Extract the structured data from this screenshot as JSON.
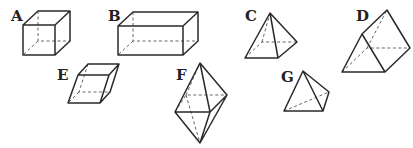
{
  "figure": {
    "shapes": [
      {
        "label": "A",
        "name": "cube"
      },
      {
        "label": "B",
        "name": "rectangular prism (cuboid)"
      },
      {
        "label": "C",
        "name": "square pyramid"
      },
      {
        "label": "D",
        "name": "triangular prism"
      },
      {
        "label": "E",
        "name": "parallelepiped"
      },
      {
        "label": "F",
        "name": "bipyramid (octahedron-like)"
      },
      {
        "label": "G",
        "name": "triangular pyramid"
      }
    ]
  },
  "labels": {
    "a": "A",
    "b": "B",
    "c": "C",
    "d": "D",
    "e": "E",
    "f": "F",
    "g": "G"
  }
}
